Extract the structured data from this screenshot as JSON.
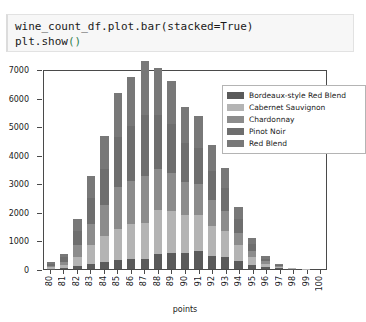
{
  "code_cell": {
    "line1_a": "wine_count_df.plot.bar(stacked=True)",
    "line2_a": "plt.show",
    "line2_paren": "()"
  },
  "chart_data": {
    "type": "bar",
    "stacked": true,
    "title": "",
    "xlabel": "points",
    "ylabel": "",
    "ylim": [
      0,
      7000
    ],
    "yticks": [
      0,
      1000,
      2000,
      3000,
      4000,
      5000,
      6000,
      7000
    ],
    "grid": false,
    "legend_position": "upper right",
    "categories": [
      "80",
      "81",
      "82",
      "83",
      "84",
      "85",
      "86",
      "87",
      "88",
      "89",
      "90",
      "91",
      "92",
      "93",
      "94",
      "95",
      "96",
      "97",
      "98",
      "99",
      "100"
    ],
    "series": [
      {
        "name": "Bordeaux-style Red Blend",
        "color": "#5a5a5a",
        "values": [
          15,
          30,
          95,
          190,
          245,
          320,
          345,
          360,
          520,
          555,
          560,
          620,
          450,
          415,
          270,
          135,
          60,
          25,
          8,
          2,
          1
        ]
      },
      {
        "name": "Cabernet Sauvignon",
        "color": "#b4b4b4",
        "values": [
          45,
          95,
          330,
          640,
          900,
          1070,
          1230,
          1240,
          1560,
          1480,
          1340,
          1280,
          1060,
          900,
          560,
          290,
          120,
          45,
          12,
          3,
          1
        ]
      },
      {
        "name": "Chardonnay",
        "color": "#8c8c8c",
        "values": [
          60,
          130,
          420,
          760,
          1080,
          1490,
          1510,
          1640,
          1430,
          1330,
          1140,
          1090,
          900,
          720,
          440,
          215,
          90,
          35,
          10,
          2,
          1
        ]
      },
      {
        "name": "Pinot Noir",
        "color": "#6e6e6e",
        "values": [
          70,
          150,
          480,
          900,
          1280,
          1730,
          1920,
          2140,
          1870,
          1700,
          1380,
          1250,
          1020,
          800,
          480,
          230,
          95,
          40,
          11,
          2,
          1
        ]
      },
      {
        "name": "Red Blend",
        "color": "#787878",
        "values": [
          60,
          135,
          425,
          780,
          1145,
          1540,
          1715,
          1900,
          1670,
          1530,
          1240,
          1110,
          910,
          715,
          430,
          205,
          85,
          35,
          9,
          2,
          1
        ]
      }
    ],
    "totals": [
      250,
      540,
      1750,
      3270,
      4650,
      6150,
      6720,
      7280,
      7050,
      6595,
      5660,
      5350,
      4340,
      3550,
      2180,
      1075,
      450,
      180,
      50,
      11,
      5
    ]
  }
}
